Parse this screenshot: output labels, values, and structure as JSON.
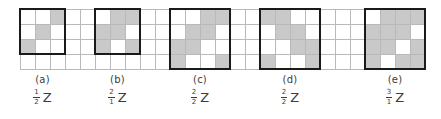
{
  "figure": {
    "name": "tiling-patterns-figure",
    "grid": {
      "cell_size": 15,
      "rows": 4,
      "cols": 27,
      "origin_x": 20,
      "origin_y": 9,
      "line_color": "#b9b9b9",
      "shade_color": "#c9c9c9",
      "bold_color": "#1a1a1a"
    },
    "panels": [
      {
        "tag": "(a)",
        "numerator": "1",
        "denominator": "2",
        "symbol": "Z",
        "box": {
          "col": 0,
          "row": 0,
          "cols": 3,
          "rows": 3
        },
        "shaded": [
          {
            "col": 2,
            "row": 0
          },
          {
            "col": 1,
            "row": 1
          },
          {
            "col": 0,
            "row": 2
          }
        ]
      },
      {
        "tag": "(b)",
        "numerator": "2",
        "denominator": "1",
        "symbol": "Z",
        "box": {
          "col": 5,
          "row": 0,
          "cols": 3,
          "rows": 3
        },
        "shaded": [
          {
            "col": 6,
            "row": 0
          },
          {
            "col": 7,
            "row": 0
          },
          {
            "col": 5,
            "row": 1
          },
          {
            "col": 6,
            "row": 1
          },
          {
            "col": 5,
            "row": 2
          },
          {
            "col": 7,
            "row": 2
          }
        ]
      },
      {
        "tag": "(c)",
        "numerator": "2",
        "denominator": "2",
        "symbol": "Z",
        "box": {
          "col": 10,
          "row": 0,
          "cols": 4,
          "rows": 4
        },
        "shaded": [
          {
            "col": 12,
            "row": 0
          },
          {
            "col": 13,
            "row": 0
          },
          {
            "col": 11,
            "row": 1
          },
          {
            "col": 12,
            "row": 1
          },
          {
            "col": 10,
            "row": 2
          },
          {
            "col": 11,
            "row": 2
          },
          {
            "col": 10,
            "row": 3
          },
          {
            "col": 13,
            "row": 3
          }
        ]
      },
      {
        "tag": "(d)",
        "numerator": "2",
        "denominator": "2",
        "symbol": "Z",
        "box": {
          "col": 16,
          "row": 0,
          "cols": 4,
          "rows": 4
        },
        "shaded": [
          {
            "col": 16,
            "row": 0
          },
          {
            "col": 17,
            "row": 0
          },
          {
            "col": 17,
            "row": 1
          },
          {
            "col": 18,
            "row": 1
          },
          {
            "col": 18,
            "row": 2
          },
          {
            "col": 19,
            "row": 2
          },
          {
            "col": 16,
            "row": 3
          },
          {
            "col": 19,
            "row": 3
          }
        ]
      },
      {
        "tag": "(e)",
        "numerator": "3",
        "denominator": "1",
        "symbol": "Z",
        "box": {
          "col": 23,
          "row": 0,
          "cols": 4,
          "rows": 4
        },
        "shaded": [
          {
            "col": 24,
            "row": 0
          },
          {
            "col": 25,
            "row": 0
          },
          {
            "col": 26,
            "row": 0
          },
          {
            "col": 23,
            "row": 1
          },
          {
            "col": 24,
            "row": 1
          },
          {
            "col": 25,
            "row": 1
          },
          {
            "col": 23,
            "row": 2
          },
          {
            "col": 24,
            "row": 2
          },
          {
            "col": 26,
            "row": 2
          },
          {
            "col": 23,
            "row": 3
          },
          {
            "col": 25,
            "row": 3
          },
          {
            "col": 26,
            "row": 3
          }
        ]
      }
    ]
  }
}
